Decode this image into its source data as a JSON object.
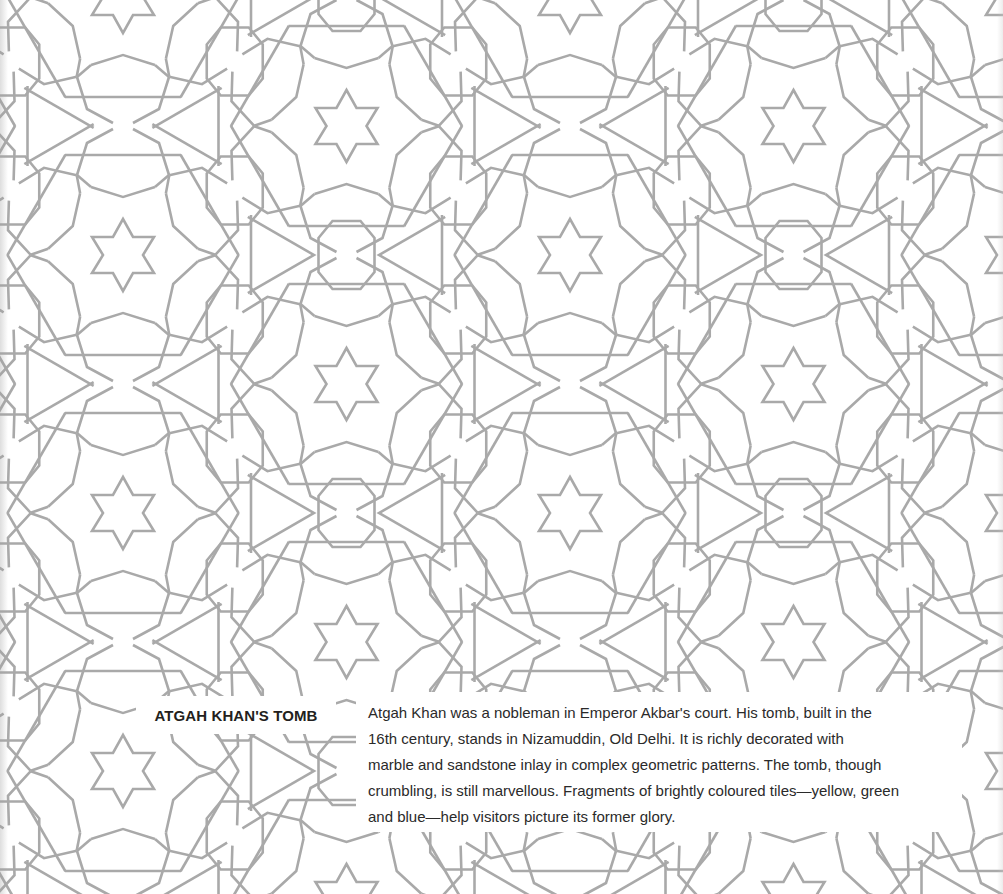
{
  "page": {
    "background_color": "#ffffff",
    "pattern": {
      "motif": "six-pointed-star-rosette-geometric-pattern",
      "stroke_color": "#a9a9a9",
      "lattice": {
        "dx": 447,
        "dy": 258,
        "origin_x": 123,
        "origin_y": 255
      }
    }
  },
  "caption": {
    "title": "ATGAH KHAN'S TOMB",
    "title_color": "#231f20",
    "body_lines": [
      "Atgah Khan was a nobleman in Emperor Akbar's court. His tomb, built in the",
      "16th century, stands in Nizamuddin, Old Delhi. It is richly decorated with",
      "marble and sandstone inlay in complex geometric patterns. The tomb, though",
      "crumbling, is still marvellous. Fragments of brightly coloured tiles—yellow, green",
      "and blue—help visitors picture its former glory."
    ],
    "body_color": "#2a2a2a"
  }
}
